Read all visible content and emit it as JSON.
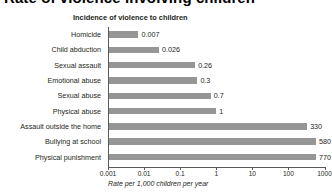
{
  "page": {
    "title": "Rate of violence involving children"
  },
  "chart_data": {
    "type": "bar",
    "orientation": "horizontal",
    "title": "Incidence of violence to children",
    "xlabel": "Rate per 1,000 children per year",
    "ylabel": "",
    "xscale": "log",
    "xlim": [
      0.001,
      1000
    ],
    "grid": false,
    "legend": null,
    "bar_color": "#969696",
    "axis_color": "#58595b",
    "tick_labels": [
      "0.001",
      "0.01",
      "0.1",
      "1",
      "10",
      "100",
      "1000"
    ],
    "tick_values": [
      0.001,
      0.01,
      0.1,
      1,
      10,
      100,
      1000
    ],
    "categories": [
      "Homicide",
      "Child abduction",
      "Sexual assault",
      "Emotional abuse",
      "Sexual abuse",
      "Physical abuse",
      "Assault outside the home",
      "Bullying at school",
      "Physical punishment"
    ],
    "values": [
      0.007,
      0.026,
      0.26,
      0.3,
      0.7,
      1,
      330,
      580,
      770
    ],
    "value_labels": [
      "0.007",
      "0.026",
      "0.26",
      "0.3",
      "0.7",
      "1",
      "330",
      "580",
      "770"
    ]
  }
}
